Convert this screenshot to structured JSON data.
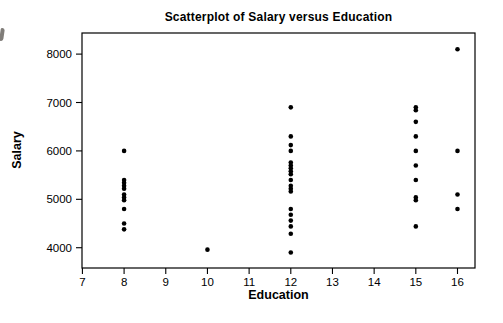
{
  "figure": {
    "background": "#ffffff",
    "foreground": "#000000"
  },
  "chart_data": {
    "type": "scatter",
    "title": "Scatterplot of Salary versus Education",
    "xlabel": "Education",
    "ylabel": "Salary",
    "legend": null,
    "grid": false,
    "marker": {
      "shape": "filled-circle",
      "color": "#000000",
      "radius_px": 2.3
    },
    "xlim": [
      6.99,
      16.42
    ],
    "ylim": [
      3581,
      8436
    ],
    "x_ticks": [
      7,
      8,
      9,
      10,
      11,
      12,
      13,
      14,
      15,
      16
    ],
    "y_ticks": [
      4000,
      5000,
      6000,
      7000,
      8000
    ],
    "points": [
      [
        8,
        6000
      ],
      [
        8,
        5400
      ],
      [
        8,
        5340
      ],
      [
        8,
        5280
      ],
      [
        8,
        5220
      ],
      [
        8,
        5100
      ],
      [
        8,
        5040
      ],
      [
        8,
        4980
      ],
      [
        8,
        4800
      ],
      [
        8,
        4500
      ],
      [
        8,
        4380
      ],
      [
        10,
        3960
      ],
      [
        12,
        6900
      ],
      [
        12,
        6300
      ],
      [
        12,
        6120
      ],
      [
        12,
        6000
      ],
      [
        12,
        5760
      ],
      [
        12,
        5700
      ],
      [
        12,
        5640
      ],
      [
        12,
        5580
      ],
      [
        12,
        5520
      ],
      [
        12,
        5400
      ],
      [
        12,
        5280
      ],
      [
        12,
        5220
      ],
      [
        12,
        5160
      ],
      [
        12,
        4800
      ],
      [
        12,
        4680
      ],
      [
        12,
        4560
      ],
      [
        12,
        4440
      ],
      [
        12,
        4290
      ],
      [
        12,
        3900
      ],
      [
        15,
        6900
      ],
      [
        15,
        6840
      ],
      [
        15,
        6600
      ],
      [
        15,
        6300
      ],
      [
        15,
        6000
      ],
      [
        15,
        5700
      ],
      [
        15,
        5400
      ],
      [
        15,
        5040
      ],
      [
        15,
        4980
      ],
      [
        15,
        4440
      ],
      [
        16,
        8100
      ],
      [
        16,
        6000
      ],
      [
        16,
        5100
      ],
      [
        16,
        4800
      ]
    ]
  },
  "plot_box_px": {
    "left": 82,
    "top": 33,
    "width": 393,
    "height": 235
  },
  "tick_style": {
    "length_px": 6,
    "label_font_px": 11.5
  }
}
